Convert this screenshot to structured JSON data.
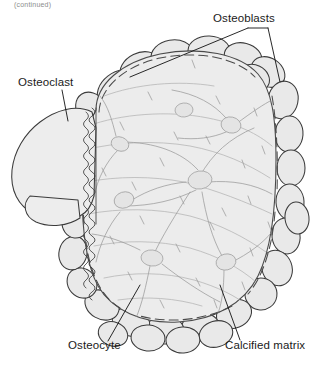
{
  "figure": {
    "clipped_header_text": "(continued)",
    "background_color": "#ffffff",
    "width": 318,
    "height": 368
  },
  "labels": [
    {
      "id": "osteoblasts",
      "text": "Osteoblasts",
      "x": 213,
      "y": 22,
      "anchor": "start"
    },
    {
      "id": "osteoclast",
      "text": "Osteoclast",
      "x": 18,
      "y": 86,
      "anchor": "start"
    },
    {
      "id": "osteocyte",
      "text": "Osteocyte",
      "x": 68,
      "y": 349,
      "anchor": "start"
    },
    {
      "id": "calcified-matrix",
      "text": "Calcified matrix",
      "x": 225,
      "y": 349,
      "anchor": "start"
    }
  ],
  "colors": {
    "matrix_fill": "#ececec",
    "osteoclast_fill": "#ededed",
    "osteoblast_fill": "#e9e9e9",
    "outline": "#3b3b3b",
    "leader_line": "#111111",
    "canaliculi": "#9a9a9a",
    "text": "#1a1a1a"
  },
  "structures": {
    "osteoclast": {
      "name": "Osteoclast",
      "description": "Large multi-lobed bone-resorbing cell at left with ruffled border",
      "fill": "#ededed"
    },
    "ruffled_border": {
      "name": "Ruffled border",
      "description": "Wavy comb-like membrane between osteoclast and calcified matrix"
    },
    "calcified_matrix": {
      "name": "Calcified matrix",
      "description": "Central mineralized bone mass with scalloped outline",
      "fill": "#ececec"
    },
    "osteoblasts": {
      "name": "Osteoblasts",
      "description": "Ring of oval bone-forming cells lining the matrix perimeter",
      "count": 28,
      "fill": "#e9e9e9"
    },
    "osteocytes": {
      "name": "Osteocytes",
      "description": "Cells embedded in lacunae within the matrix with radiating canaliculi",
      "count": 7
    }
  }
}
